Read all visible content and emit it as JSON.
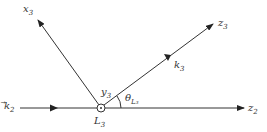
{
  "diagram": {
    "axes": {
      "x3": {
        "label": "x",
        "sub": "3"
      },
      "z3": {
        "label": "z",
        "sub": "3"
      },
      "z2": {
        "label": "z",
        "sub": "2"
      },
      "y3": {
        "label": "y",
        "sub": "3"
      }
    },
    "vectors": {
      "k2": {
        "label": "k",
        "sub": "2"
      },
      "k3": {
        "label": "k",
        "sub": "3"
      }
    },
    "origin": {
      "label": "L",
      "sub": "3"
    },
    "angle": {
      "label": "θ",
      "sub": "L₃"
    },
    "colors": {
      "stroke": "#333333",
      "background": "#ffffff"
    }
  }
}
